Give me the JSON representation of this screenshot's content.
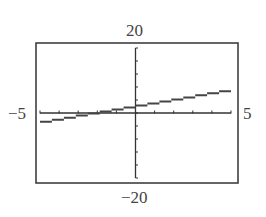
{
  "chart_data": {
    "type": "line",
    "title": "",
    "xlabel": "",
    "ylabel": "",
    "xlim": [
      -5,
      5
    ],
    "ylim": [
      -20,
      20
    ],
    "x_tick_step": 1,
    "y_tick_step": 4,
    "grid": false,
    "window_labels": {
      "ymax": "20",
      "ymin": "-20",
      "xmin": "-5",
      "xmax": "5"
    },
    "series": [
      {
        "name": "line",
        "x": [
          -5,
          5
        ],
        "values": [
          -3,
          7
        ],
        "equation_estimate": "y = x + 2",
        "style": "pixelated stair-step"
      }
    ],
    "colors": {
      "line": "#444444",
      "frame": "#333333",
      "axes": "#333333"
    }
  },
  "labels": {
    "top": "20",
    "bottom": "−20",
    "left": "−5",
    "right": "5"
  }
}
